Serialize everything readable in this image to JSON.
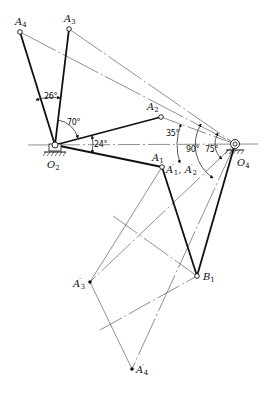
{
  "diagram": {
    "type": "four-bar linkage synthesis (inversion method)",
    "points": {
      "O2": {
        "label": "O",
        "sub": "2",
        "x": 55,
        "y": 145
      },
      "O4": {
        "label": "O",
        "sub": "4",
        "x": 235,
        "y": 144
      },
      "A1": {
        "label": "A",
        "sub": "1",
        "x": 162,
        "y": 167
      },
      "A2": {
        "label": "A",
        "sub": "2",
        "x": 161,
        "y": 117
      },
      "A3": {
        "label": "A",
        "sub": "3",
        "x": 69,
        "y": 29
      },
      "A4": {
        "label": "A",
        "sub": "4",
        "x": 20,
        "y": 32
      },
      "B1": {
        "label": "B",
        "sub": "1",
        "x": 197,
        "y": 276
      },
      "A3p": {
        "label": "A",
        "sub": "3",
        "prime": "′",
        "x": 90,
        "y": 282
      },
      "A4p": {
        "label": "A",
        "sub": "4",
        "prime": "′",
        "x": 132,
        "y": 369
      }
    },
    "combined_label": {
      "text_a": "A",
      "sub1": "1",
      "text_sep": ", A",
      "sub2": "2",
      "prime": "′"
    },
    "angles": {
      "a26": "26°",
      "a70": "70°",
      "a24": "24°",
      "a35": "35°",
      "a90": "90°",
      "a75": "75°"
    },
    "colors": {
      "ink": "#111111",
      "thin": "#444444",
      "background": "#ffffff"
    }
  }
}
